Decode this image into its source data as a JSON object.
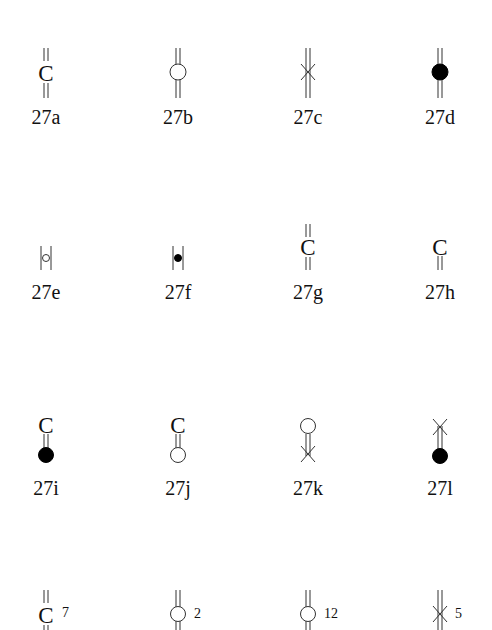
{
  "figure": {
    "rows": [
      {
        "items": [
          {
            "id": "27a",
            "label": "27a",
            "symbol": "double-line-with-C",
            "c_glyph": "C"
          },
          {
            "id": "27b",
            "label": "27b",
            "symbol": "double-line-with-open-circle"
          },
          {
            "id": "27c",
            "label": "27c",
            "symbol": "double-line-with-cross"
          },
          {
            "id": "27d",
            "label": "27d",
            "symbol": "double-line-with-filled-circle"
          }
        ]
      },
      {
        "items": [
          {
            "id": "27e",
            "label": "27e",
            "symbol": "bracketed-open-circle"
          },
          {
            "id": "27f",
            "label": "27f",
            "symbol": "bracketed-filled-circle"
          },
          {
            "id": "27g",
            "label": "27g",
            "symbol": "double-line-with-C",
            "c_glyph": "C"
          },
          {
            "id": "27h",
            "label": "27h",
            "symbol": "C-with-lower-double-line",
            "c_glyph": "C"
          }
        ]
      },
      {
        "items": [
          {
            "id": "27i",
            "label": "27i",
            "symbol": "C-linked-filled-circle",
            "c_glyph": "C"
          },
          {
            "id": "27j",
            "label": "27j",
            "symbol": "C-linked-open-circle",
            "c_glyph": "C"
          },
          {
            "id": "27k",
            "label": "27k",
            "symbol": "open-circle-linked-cross"
          },
          {
            "id": "27l",
            "label": "27l",
            "symbol": "cross-linked-filled-circle"
          }
        ]
      },
      {
        "items": [
          {
            "id": "r4a",
            "symbol": "double-line-with-C",
            "c_glyph": "C",
            "count": "7"
          },
          {
            "id": "r4b",
            "symbol": "double-line-with-open-circle",
            "count": "2"
          },
          {
            "id": "r4c",
            "symbol": "double-line-with-open-circle",
            "count": "12"
          },
          {
            "id": "r4d",
            "symbol": "double-line-with-cross",
            "count": "5"
          }
        ]
      }
    ]
  }
}
